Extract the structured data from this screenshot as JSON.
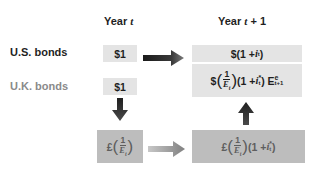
{
  "headers": {
    "year_t": {
      "prefix": "Year ",
      "var": "t"
    },
    "year_t1": {
      "prefix": "Year ",
      "var": "t",
      "suffix": " + 1"
    }
  },
  "rows": {
    "us": {
      "label": "U.S. bonds",
      "value": "$1"
    },
    "uk": {
      "label": "U.K. bonds",
      "value": "$1"
    }
  },
  "boxes": {
    "us_return": {
      "currency": "$",
      "open": "(1 + ",
      "var": "i",
      "sub": "t",
      "close": ")"
    },
    "uk_return_dollars": {
      "currency": "$",
      "num": "1",
      "den": "E",
      "den_sub": "t",
      "mid": "(1 + ",
      "var": "i",
      "sup": "*",
      "sub": "t",
      "close": ") E",
      "e_sup": "e",
      "e_sub": "t+1"
    },
    "pounds_t": {
      "currency": "£",
      "num": "1",
      "den": "E",
      "den_sub": "t"
    },
    "pounds_t1": {
      "currency": "£",
      "num": "1",
      "den": "E",
      "den_sub": "t",
      "mid": "(1 + ",
      "var": "i",
      "sup": "*",
      "sub": "t",
      "close": ")"
    }
  },
  "colors": {
    "light_box": "#e4e4e4",
    "dark_box": "#bdbdbd",
    "dark_arrow": "#2b2b2b",
    "gray_arrow": "#8c8c8c",
    "uk_label": "#8a8a8a"
  }
}
